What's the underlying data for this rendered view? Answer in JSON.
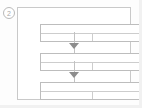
{
  "figure": {
    "step_marker": "2",
    "caption": "",
    "type": "vertical-flow-diagram",
    "colors": {
      "background": "#fdfdfd",
      "frame_border": "#c9c9c9",
      "box_border": "#bdbdbd",
      "inner_rule": "#cdcdcd",
      "connector": "#c2c2c2",
      "arrow_fill": "#8d8d8d",
      "marker_text": "#a8a8a8"
    },
    "outer_frame": {
      "label": ""
    },
    "boxes": [
      {
        "id": "box-1",
        "label": "",
        "header_text": "",
        "body_left_text": "",
        "body_right_text": ""
      },
      {
        "id": "box-2",
        "label": "",
        "header_text": "",
        "body_left_text": "",
        "body_right_text": ""
      },
      {
        "id": "box-3",
        "label": "",
        "header_text": "",
        "body_left_text": "",
        "body_right_text": ""
      }
    ],
    "connectors": [
      {
        "id": "connector-1",
        "from": "box-1",
        "to": "box-2",
        "arrow": "down-arrow-icon",
        "label": ""
      },
      {
        "id": "connector-2",
        "from": "box-2",
        "to": "box-3",
        "arrow": "down-arrow-icon",
        "label": ""
      }
    ]
  }
}
